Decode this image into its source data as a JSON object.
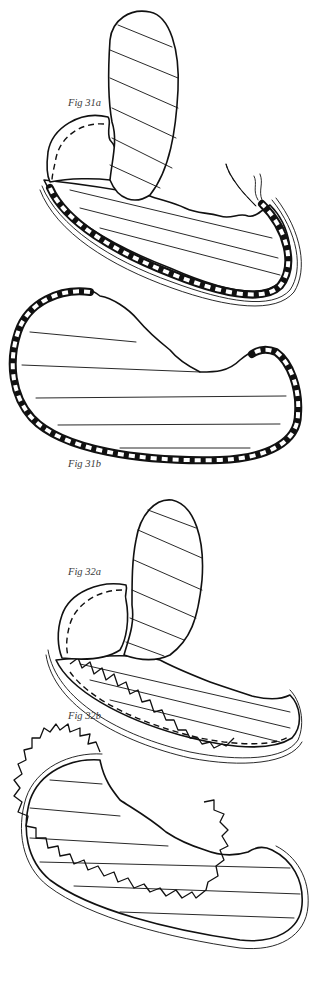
{
  "figures": [
    {
      "id": "fig-31a",
      "label": "Fig 31a",
      "description": "Striped fabric piece with checked bias binding being stitched around the edge"
    },
    {
      "id": "fig-31b",
      "label": "Fig 31b",
      "description": "Finished piece with checked binding along curved edge"
    },
    {
      "id": "fig-32a",
      "label": "Fig 32a",
      "description": "Striped fabric piece with ruffle pinned around edge"
    },
    {
      "id": "fig-32b",
      "label": "Fig 32b",
      "description": "Finished piece with ruffle edging"
    }
  ],
  "colors": {
    "ink": "#111111",
    "label": "#3a3a3a",
    "background": "#ffffff"
  }
}
